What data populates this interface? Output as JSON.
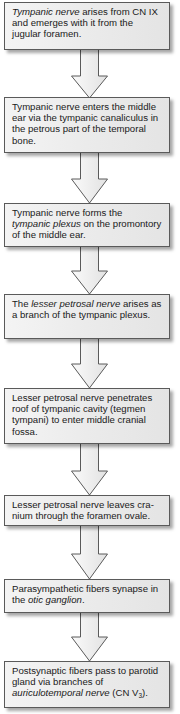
{
  "diagram": {
    "type": "flowchart",
    "direction": "top-to-bottom",
    "colors": {
      "box_fill": "#ececec",
      "box_border": "#5a5a5a",
      "arrow_fill": "#f0f0f0",
      "arrow_stroke": "#5a5a5a",
      "text": "#1a1a1a"
    },
    "steps": [
      {
        "id": 1,
        "parts": [
          {
            "text": "Tympanic nerve",
            "italic": true
          },
          {
            "text": " arises from CN IX and emerges with it from the jugular foramen.",
            "italic": false
          }
        ]
      },
      {
        "id": 2,
        "parts": [
          {
            "text": "Tympanic nerve enters the middle ear via the tympanic canaliculus in the petrous part of the temporal bone.",
            "italic": false
          }
        ]
      },
      {
        "id": 3,
        "parts": [
          {
            "text": "Tympanic nerve forms the ",
            "italic": false
          },
          {
            "text": "tympanic plexus",
            "italic": true
          },
          {
            "text": " on the promontory of the middle ear.",
            "italic": false
          }
        ]
      },
      {
        "id": 4,
        "parts": [
          {
            "text": "The ",
            "italic": false
          },
          {
            "text": "lesser petrosal nerve",
            "italic": true
          },
          {
            "text": " arises as a branch of the tympanic plexus.",
            "italic": false
          }
        ]
      },
      {
        "id": 5,
        "parts": [
          {
            "text": "Lesser petrosal nerve penetrates roof of tympanic cavity (tegmen tympani) to enter middle cranial fossa.",
            "italic": false
          }
        ]
      },
      {
        "id": 6,
        "parts": [
          {
            "text": "Lesser petrosal nerve leaves cra-nium through the foramen ovale.",
            "italic": false
          }
        ]
      },
      {
        "id": 7,
        "parts": [
          {
            "text": "Parasympathetic fibers synapse in the ",
            "italic": false
          },
          {
            "text": "otic ganglion",
            "italic": true
          },
          {
            "text": ".",
            "italic": false
          }
        ]
      },
      {
        "id": 8,
        "parts": [
          {
            "text": "Postsynaptic fibers pass to parotid gland via branches of ",
            "italic": false
          },
          {
            "text": "auriculotemporal nerve",
            "italic": true
          },
          {
            "text": " (CN V",
            "italic": false
          },
          {
            "text": "3",
            "italic": false,
            "subscript": true
          },
          {
            "text": ").",
            "italic": false
          }
        ]
      }
    ],
    "arrows": [
      {
        "from": 1,
        "to": 2,
        "label": "down-arrow"
      },
      {
        "from": 2,
        "to": 3,
        "label": "down-arrow"
      },
      {
        "from": 3,
        "to": 4,
        "label": "down-arrow"
      },
      {
        "from": 4,
        "to": 5,
        "label": "down-arrow"
      },
      {
        "from": 5,
        "to": 6,
        "label": "down-arrow"
      },
      {
        "from": 6,
        "to": 7,
        "label": "down-arrow"
      },
      {
        "from": 7,
        "to": 8,
        "label": "down-arrow"
      }
    ]
  },
  "text": {
    "s1a": "Tympanic nerve",
    "s1b": " arises from CN IX and emerges with it from the jugular foramen.",
    "s2": "Tympanic nerve enters the middle ear via the tympanic canaliculus in the petrous part of the temporal bone.",
    "s3a": "Tympanic nerve forms the ",
    "s3b": "tympanic plexus",
    "s3c": " on the promontory of the middle ear.",
    "s4a": "The ",
    "s4b": "lesser petrosal nerve",
    "s4c": " arises as a branch of the tympanic plexus.",
    "s5": "Lesser petrosal nerve penetrates roof of tympanic cavity (tegmen tympani) to enter middle cranial fossa.",
    "s6": "Lesser petrosal nerve leaves cra-nium through the foramen ovale.",
    "s7a": "Parasympathetic fibers synapse in the ",
    "s7b": "otic ganglion",
    "s7c": ".",
    "s8a": "Postsynaptic fibers pass to parotid gland via branches of ",
    "s8b": "auriculotemporal nerve",
    "s8c": " (CN V",
    "s8d": "3",
    "s8e": ")."
  }
}
